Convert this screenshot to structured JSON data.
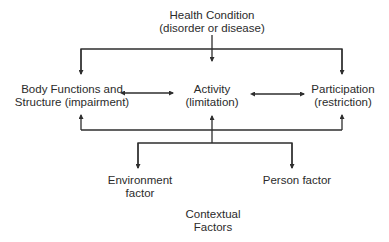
{
  "diagram": {
    "nodes": {
      "health_condition": {
        "line1": "Health Condition",
        "line2": "(disorder or disease)"
      },
      "body_functions": {
        "line1": "Body Functions and",
        "line2": "Structure (impairment)"
      },
      "activity": {
        "line1": "Activity",
        "line2": "(limitation)"
      },
      "participation": {
        "line1": "Participation",
        "line2": "(restriction)"
      },
      "environment": {
        "line1": "Environment",
        "line2": "factor"
      },
      "person": {
        "line1": "Person factor"
      },
      "contextual": {
        "line1": "Contextual",
        "line2": "Factors"
      }
    },
    "edges": [
      {
        "from": "health_condition",
        "to": "body_functions",
        "type": "arrow"
      },
      {
        "from": "health_condition",
        "to": "activity",
        "type": "arrow"
      },
      {
        "from": "health_condition",
        "to": "participation",
        "type": "arrow"
      },
      {
        "from": "body_functions",
        "to": "activity",
        "type": "bidirectional"
      },
      {
        "from": "activity",
        "to": "participation",
        "type": "bidirectional"
      },
      {
        "from": "contextual_bus",
        "to": "body_functions",
        "type": "arrow"
      },
      {
        "from": "contextual_bus",
        "to": "activity",
        "type": "arrow"
      },
      {
        "from": "contextual_bus",
        "to": "participation",
        "type": "arrow"
      },
      {
        "from": "contextual_bus",
        "to": "environment",
        "type": "arrow"
      },
      {
        "from": "contextual_bus",
        "to": "person",
        "type": "arrow"
      }
    ],
    "line_color": "#2e2e2e"
  }
}
